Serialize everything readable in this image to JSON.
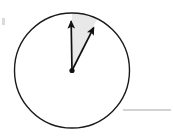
{
  "figure": {
    "canvas": {
      "width": 173,
      "height": 138,
      "background": "#ffffff"
    },
    "circle": {
      "name": "circle-outline",
      "center_x": 72,
      "center_y": 70.5,
      "radius": 57.5,
      "stroke": "#1a1a1a",
      "stroke_width": 1.4,
      "fill": "none"
    },
    "center_point": {
      "name": "center-dot",
      "x": 72,
      "y": 70.5,
      "radius": 2.6,
      "fill": "#111111"
    },
    "sector": {
      "name": "shaded-sector",
      "fill": "#e8e8e8",
      "start_angle_deg": 90,
      "end_angle_deg": 64,
      "sweep_deg": 26,
      "description": "shaded region between the two vectors"
    },
    "vectors": [
      {
        "name": "vector-arrow-vertical",
        "from_x": 72,
        "from_y": 70.5,
        "to_x": 71,
        "to_y": 14,
        "angle_deg": 90,
        "stroke": "#111111",
        "stroke_width": 1.7,
        "arrowhead": "filled-triangle"
      },
      {
        "name": "vector-arrow-diagonal",
        "from_x": 72,
        "from_y": 70.5,
        "to_x": 97,
        "to_y": 21,
        "angle_deg": 63,
        "stroke": "#111111",
        "stroke_width": 1.7,
        "arrowhead": "filled-triangle"
      }
    ],
    "baseline": {
      "name": "horizontal-rule",
      "x1": 123,
      "x2": 171,
      "y": 110,
      "stroke": "#a6a6a6",
      "stroke_width": 1.1
    },
    "edge_mark": {
      "name": "left-edge-mark",
      "x": 2,
      "y": 18,
      "width": 3,
      "height": 7,
      "fill": "#dadada"
    }
  }
}
